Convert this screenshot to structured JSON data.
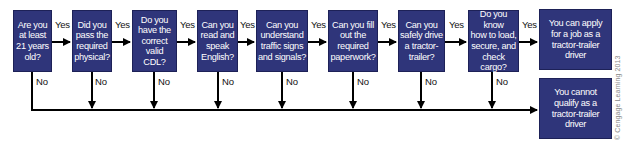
{
  "diagram": {
    "type": "flowchart",
    "colors": {
      "box_fill": "#2f357a",
      "box_border": "#1d2157",
      "box_text": "#ffffff",
      "connector": "#000000"
    },
    "questions": [
      {
        "id": "q1",
        "text": "Are you\nat least\n21 years\nold?"
      },
      {
        "id": "q2",
        "text": "Did you\npass the\nrequired\nphysical?"
      },
      {
        "id": "q3",
        "text": "Do you\nhave the\ncorrect\nvalid CDL?"
      },
      {
        "id": "q4",
        "text": "Can you\nread and\nspeak\nEnglish?"
      },
      {
        "id": "q5",
        "text": "Can you\nunderstand\ntraffic signs\nand signals?"
      },
      {
        "id": "q6",
        "text": "Can you fill\nout the\nrequired\npaperwork?"
      },
      {
        "id": "q7",
        "text": "Can you\nsafely drive\na tractor-\ntrailer?"
      },
      {
        "id": "q8",
        "text": "Do you know\nhow to load,\nsecure, and\ncheck cargo?"
      }
    ],
    "outcomes": {
      "yes": "You can apply\nfor a job as a\ntractor-trailer\ndriver",
      "no": "You cannot\nqualify as a\ntractor-trailer\ndriver"
    },
    "edge_labels": {
      "yes": "Yes",
      "no": "No"
    },
    "copyright": "© Cengage Learning 2013"
  }
}
